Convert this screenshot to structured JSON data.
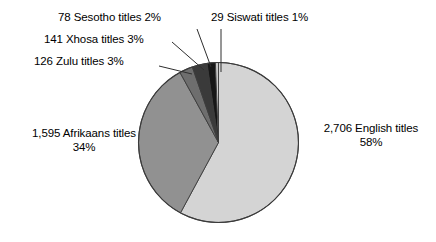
{
  "chart_data": {
    "type": "pie",
    "title": "",
    "subtitle": "",
    "xlabel": "",
    "ylabel": "",
    "legend_position": "none",
    "grid": false,
    "total_titles": 4675,
    "start_angle_deg": 0,
    "direction": "clockwise",
    "categories": [
      "English",
      "Afrikaans",
      "Zulu",
      "Xhosa",
      "Sesotho",
      "Siswati"
    ],
    "values": [
      2706,
      1595,
      126,
      141,
      78,
      29
    ],
    "percents": [
      58,
      34,
      3,
      3,
      2,
      1
    ],
    "colors": [
      "#d4d4d4",
      "#919191",
      "#6e6e6e",
      "#3a3a3a",
      "#161616",
      "#c9c9c9"
    ],
    "slices": [
      {
        "name": "English",
        "count": "2,706",
        "count_raw": 2706,
        "percent": 58,
        "percent_text": "58%",
        "label_line1": "2,706 English titles",
        "label_line2": "58%",
        "color": "#d4d4d4"
      },
      {
        "name": "Afrikaans",
        "count": "1,595",
        "count_raw": 1595,
        "percent": 34,
        "percent_text": "34%",
        "label_line1": "1,595 Afrikaans titles",
        "label_line2": "34%",
        "color": "#919191"
      },
      {
        "name": "Zulu",
        "count": "126",
        "count_raw": 126,
        "percent": 3,
        "percent_text": "3%",
        "label_line1": "126 Zulu titles 3%",
        "label_line2": "",
        "color": "#6e6e6e"
      },
      {
        "name": "Xhosa",
        "count": "141",
        "count_raw": 141,
        "percent": 3,
        "percent_text": "3%",
        "label_line1": "141 Xhosa titles 3%",
        "label_line2": "",
        "color": "#3a3a3a"
      },
      {
        "name": "Sesotho",
        "count": "78",
        "count_raw": 78,
        "percent": 2,
        "percent_text": "2%",
        "label_line1": "78 Sesotho titles 2%",
        "label_line2": "",
        "color": "#161616"
      },
      {
        "name": "Siswati",
        "count": "29",
        "count_raw": 29,
        "percent": 1,
        "percent_text": "1%",
        "label_line1": "29 Siswati titles 1%",
        "label_line2": "",
        "color": "#c9c9c9"
      }
    ]
  },
  "labels": {
    "sesotho": "78 Sesotho titles 2%",
    "siswati": "29 Siswati titles 1%",
    "xhosa": "141 Xhosa titles 3%",
    "zulu": "126 Zulu titles 3%",
    "afrikaans_line1": "1,595 Afrikaans titles",
    "afrikaans_line2": "34%",
    "english_line1": "2,706 English titles",
    "english_line2": "58%"
  },
  "style": {
    "background": "#ffffff",
    "outline": "#3b3b3b",
    "text_color": "#000000"
  }
}
